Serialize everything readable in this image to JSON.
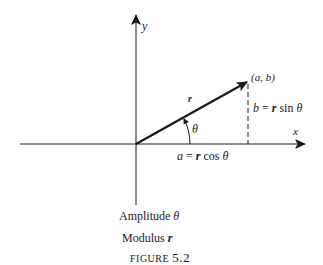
{
  "figure": {
    "caption_word": "FIGURE",
    "caption_number": "5.2"
  },
  "axes": {
    "x_label": "x",
    "y_label": "y"
  },
  "vector": {
    "point_label": "(a, b)",
    "magnitude_label": "r",
    "angle_label": "θ"
  },
  "components": {
    "horizontal": {
      "lhs": "a",
      "eq": " = ",
      "r": "r",
      "fn": " cos ",
      "theta": "θ"
    },
    "vertical": {
      "lhs": "b",
      "eq": " = ",
      "r": "r",
      "fn": " sin ",
      "theta": "θ"
    }
  },
  "legend": {
    "amplitude": {
      "word": "Amplitude ",
      "symbol": "θ"
    },
    "modulus": {
      "word": "Modulus ",
      "symbol": "r"
    }
  },
  "colors": {
    "ink": "#1a1a1a",
    "background": "#ffffff"
  }
}
